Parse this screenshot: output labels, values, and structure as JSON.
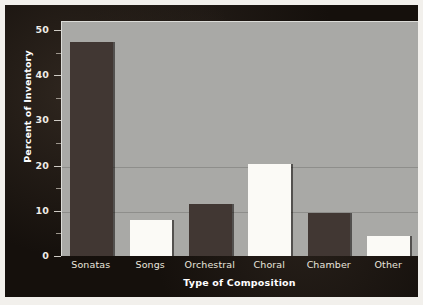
{
  "chart_data": {
    "type": "bar",
    "title": "",
    "xlabel": "Type of Composition",
    "ylabel": "Percent of Inventory",
    "categories": [
      "Sonatas",
      "Songs",
      "Orchestral",
      "Choral",
      "Chamber",
      "Other"
    ],
    "values": [
      47.3,
      7.9,
      11.4,
      20.3,
      9.6,
      4.4
    ],
    "bar_styles": [
      "dark",
      "light",
      "dark",
      "light",
      "dark",
      "light"
    ],
    "ylim": [
      0,
      52
    ],
    "ytick_labels": [
      "0",
      "10",
      "20",
      "30",
      "40",
      "50"
    ],
    "ytick_values": [
      0,
      10,
      20,
      30,
      40,
      50
    ],
    "yminor_values": [
      5,
      15,
      25,
      35,
      45
    ],
    "gridlines": [
      10,
      20
    ],
    "grid": true,
    "legend": "none"
  },
  "colors": {
    "panel_background": "#15100c",
    "plot_background": "#a9a9a6",
    "bar_dark": "#413733",
    "bar_light": "#fbfaf6",
    "gridline": "#8e8e8b",
    "axis_text": "#efece6",
    "page_background": "#f2f0ec"
  }
}
